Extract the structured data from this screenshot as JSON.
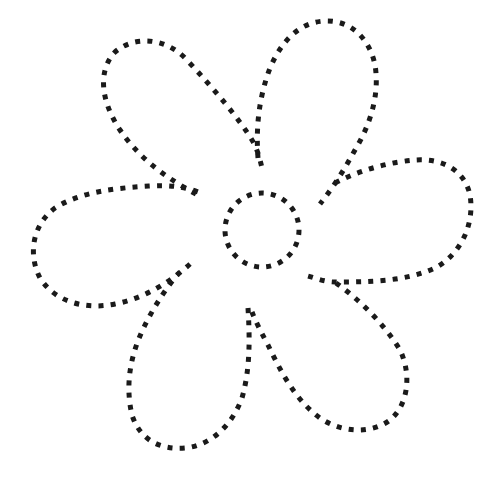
{
  "image": {
    "kind": "dotted-line tracing worksheet",
    "subject": "flower",
    "petal_count": 5,
    "has_center_circle": true,
    "background_color": "#ffffff",
    "dot_color": "#1a1a1a"
  },
  "shapes": {
    "center": {
      "cx": 262,
      "cy": 230,
      "r": 37
    },
    "petals": [
      {
        "name": "top-left-petal"
      },
      {
        "name": "top-right-petal"
      },
      {
        "name": "right-petal"
      },
      {
        "name": "bottom-right-petal"
      },
      {
        "name": "bottom-petal"
      },
      {
        "name": "left-petal"
      }
    ]
  }
}
